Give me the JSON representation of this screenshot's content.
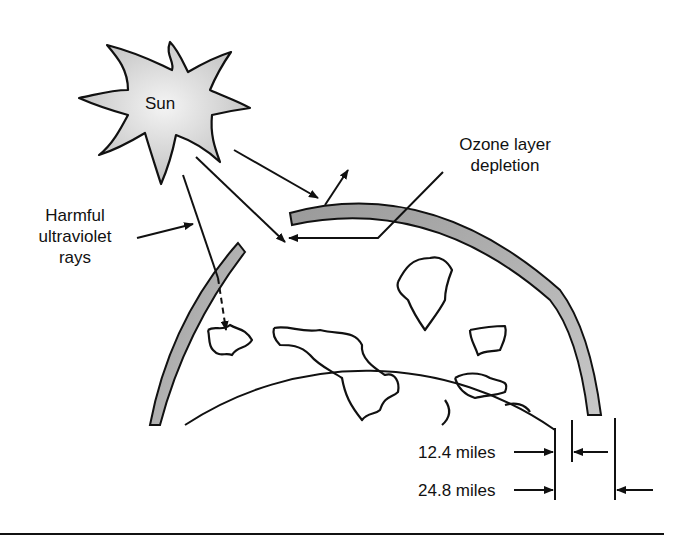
{
  "diagram": {
    "labels": {
      "sun": "Sun",
      "ozone_line1": "Ozone layer",
      "ozone_line2": "depletion",
      "harmful_line1": "Harmful",
      "harmful_line2": "ultraviolet",
      "harmful_line3": "rays",
      "dim_inner": "12.4 miles",
      "dim_outer": "24.8 miles"
    },
    "colors": {
      "stroke": "#111111",
      "band_fill": "#b8b8b8",
      "sun_fill": "#dcdcdc",
      "background": "#ffffff"
    }
  }
}
